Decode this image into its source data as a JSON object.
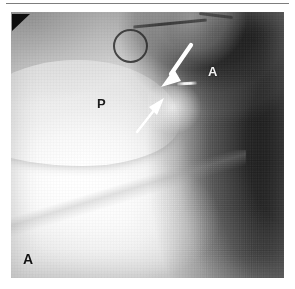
{
  "figure": {
    "panel_label": "A",
    "modality_note": "angiogram",
    "top_rule": "horizontal-rule"
  },
  "labels": {
    "aorta": "A",
    "pulmonary_artery": "P",
    "panel": "A"
  },
  "markers": {
    "corner_triangle": "corner-triangle-marker",
    "large_arrow": "large-white-arrow",
    "small_arrow": "small-white-arrow",
    "bright_streak": "radiopaque-marker-streak"
  },
  "catheter": {
    "loop": "catheter-loop",
    "tube": "catheter-tube",
    "tip": "catheter-tip"
  },
  "colors": {
    "page_background": "#ffffff",
    "plate_background": "#b9b9b9",
    "arrow_fill": "#ffffff",
    "dark_label": "#1d1d1d",
    "light_label": "#f2f2f2",
    "rule": "#7d7d7d",
    "triangle": "#101010"
  }
}
